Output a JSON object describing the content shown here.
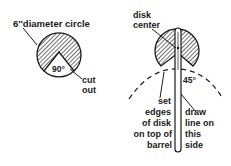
{
  "left_figure": {
    "title_label": "6″diameter circle",
    "angle_label": "90°",
    "cutout_label_line1": "cut",
    "cutout_label_line2": "out"
  },
  "right_figure": {
    "center_label_line1": "disk",
    "center_label_line2": "center",
    "angle_label": "45°",
    "set_label_lines": [
      "set",
      "edges",
      "of disk",
      "on top of",
      "barrel"
    ],
    "draw_label_lines": [
      "draw",
      "line on",
      "this",
      "side"
    ]
  },
  "colors": {
    "ink": "#1a1a1a",
    "background": "#ffffff"
  }
}
